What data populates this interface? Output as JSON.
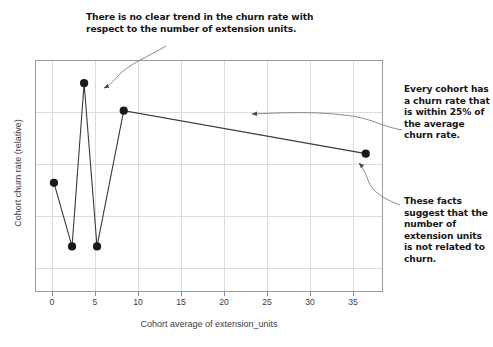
{
  "annotations": [
    {
      "id": "no-trend",
      "text": "There is no clear trend in the churn rate with respect to the number of extension units."
    },
    {
      "id": "within-25-percent",
      "text": "Every cohort has a churn rate that is within 25% of the average churn rate."
    },
    {
      "id": "not-related",
      "text": "These facts suggest that the number of extension units is not related to churn."
    }
  ],
  "chart_data": {
    "type": "line",
    "title": "",
    "xlabel": "Cohort average of extension_units",
    "ylabel": "Cohort churn rate (relative)",
    "x": [
      0.3,
      2.4,
      3.8,
      5.3,
      8.4,
      36.5
    ],
    "y": [
      0.635,
      0.265,
      1.215,
      0.265,
      1.055,
      0.805
    ],
    "xlim": [
      -1.9,
      38.5
    ],
    "ylim": [
      0.0,
      1.35
    ],
    "xticks": [
      0,
      5,
      10,
      15,
      20,
      25,
      30,
      35
    ],
    "xticklabels": [
      "0",
      "5",
      "10",
      "15",
      "20",
      "25",
      "30",
      "35"
    ],
    "yticks": [],
    "yticklabels": [],
    "grid": true,
    "legend": false,
    "marker": "circle",
    "marker_color": "#1a1a1a",
    "line_color": "#3a3a3a",
    "grid_color": "#dcdcdc",
    "frame_color": "#9a9a9a"
  },
  "colors": {
    "background": "#ffffff",
    "text": "#161616",
    "axis_text": "#3d3d3d"
  }
}
